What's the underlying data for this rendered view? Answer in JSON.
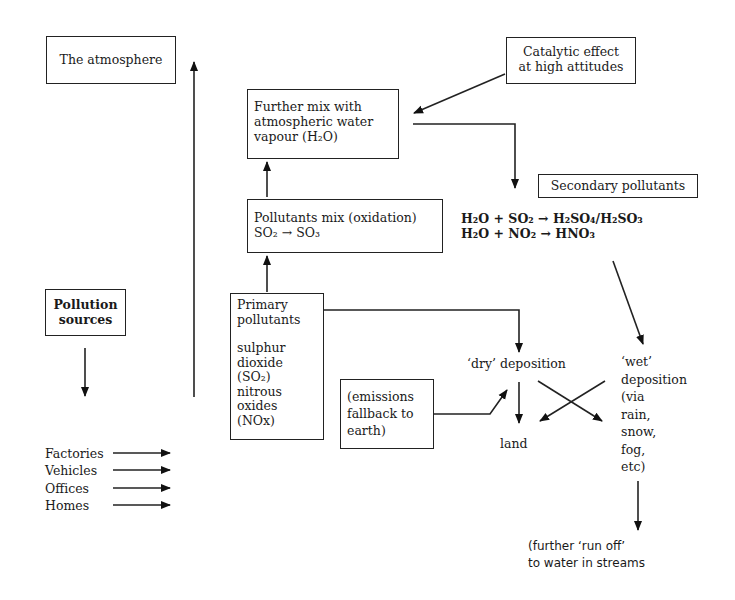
{
  "diagram": {
    "type": "flowchart",
    "nodes": {
      "atmosphere": "The atmosphere",
      "catalytic": [
        "Catalytic effect",
        "at high attitudes"
      ],
      "further_mix": [
        "Further mix with",
        "atmospheric water",
        "vapour (H₂O)"
      ],
      "oxidation": [
        "Pollutants mix (oxidation)",
        "SO₂ → SO₃"
      ],
      "secondary": "Secondary pollutants",
      "equations": [
        "H₂O + SO₂ → H₂SO₄/H₂SO₃",
        "H₂O + NO₂ → HNO₃"
      ],
      "pollution_sources": [
        "Pollution",
        "sources"
      ],
      "primary": [
        "Primary",
        "pollutants",
        "",
        "sulphur",
        "dioxide",
        "(SO₂)",
        "nitrous",
        "oxides",
        "(NOx)"
      ],
      "sources_list": [
        "Factories",
        "Vehicles",
        "Offices",
        "Homes"
      ],
      "dry_deposition": "‘dry’ deposition",
      "wet_deposition": [
        "‘wet’",
        "deposition",
        "(via",
        "rain,",
        "snow,",
        "fog,",
        "etc)"
      ],
      "emissions": [
        "(emissions",
        "fallback to",
        "earth)"
      ],
      "land": "land",
      "run_off": [
        "(further ‘run off’",
        "to water in streams"
      ]
    }
  }
}
